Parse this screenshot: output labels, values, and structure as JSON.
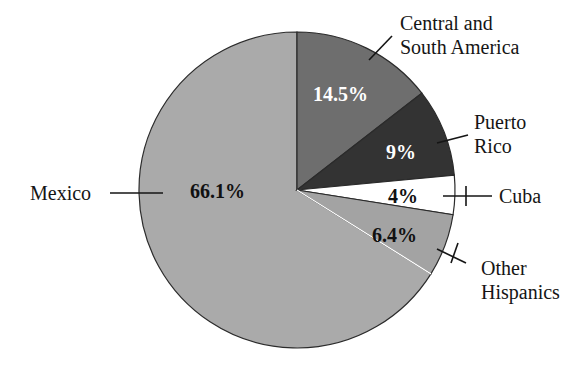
{
  "chart_data": {
    "type": "pie",
    "title": "",
    "subtitle": "",
    "xlabel": "",
    "ylabel": "",
    "legend_position": "callout-labels",
    "grid": false,
    "start_angle_deg": -90,
    "direction": "clockwise",
    "center": {
      "x": 297,
      "y": 190
    },
    "radius": 158,
    "categories": [
      "Central and South America",
      "Puerto Rico",
      "Cuba",
      "Other Hispanics",
      "Mexico"
    ],
    "values": [
      14.5,
      9,
      4,
      6.4,
      66.1
    ],
    "value_labels": [
      "14.5%",
      "9%",
      "4%",
      "6.4%",
      "66.1%"
    ],
    "slices": [
      {
        "name": "Central and South America",
        "value": 14.5,
        "value_label": "14.5%",
        "color": "#6e6e6e",
        "label_color": "#ffffff",
        "label_line1": "Central and",
        "label_line2": "South America"
      },
      {
        "name": "Puerto Rico",
        "value": 9,
        "value_label": "9%",
        "color": "#333333",
        "label_color": "#ffffff",
        "label_line1": "Puerto",
        "label_line2": "Rico"
      },
      {
        "name": "Cuba",
        "value": 4,
        "value_label": "4%",
        "color": "#ffffff",
        "label_color": "#111111",
        "label_line1": "Cuba",
        "label_line2": ""
      },
      {
        "name": "Other Hispanics",
        "value": 6.4,
        "value_label": "6.4%",
        "color": "#a3a3a3",
        "label_color": "#111111",
        "label_line1": "Other",
        "label_line2": "Hispanics"
      },
      {
        "name": "Mexico",
        "value": 66.1,
        "value_label": "66.1%",
        "color": "#aaaaaa",
        "label_color": "#111111",
        "label_line1": "Mexico",
        "label_line2": ""
      }
    ],
    "colors": {
      "central_south_america": "#6e6e6e",
      "puerto_rico": "#333333",
      "cuba": "#ffffff",
      "other_hispanics": "#a3a3a3",
      "mexico": "#aaaaaa",
      "outline": "#2b2b2b",
      "text": "#151515",
      "background": "#ffffff"
    }
  },
  "footer": {
    "cut_off_text": ""
  }
}
